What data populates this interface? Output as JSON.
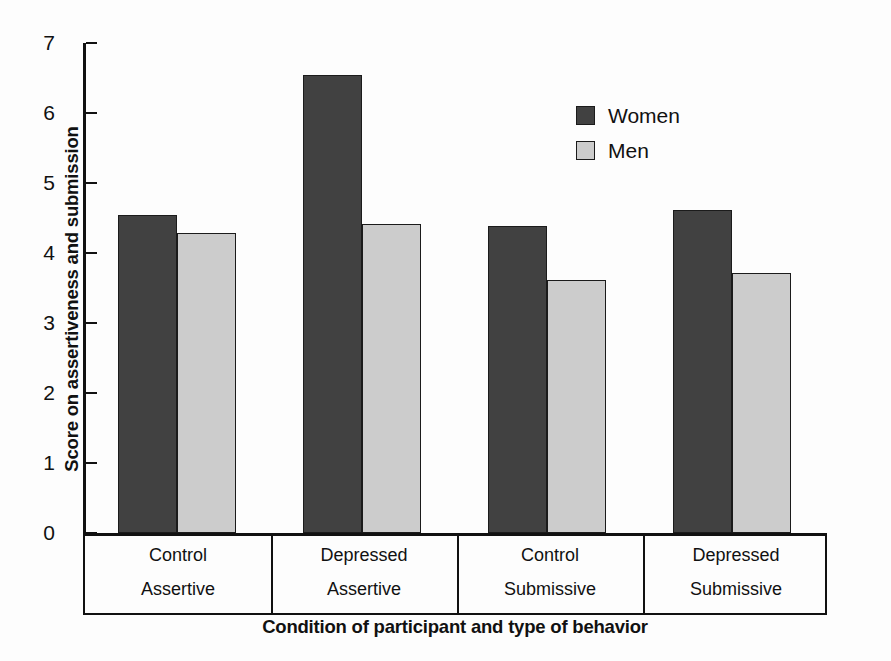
{
  "chart_data": {
    "type": "bar",
    "title": "",
    "xlabel": "Condition of participant and type of behavior",
    "ylabel": "Score on assertiveness and submission",
    "ylim": [
      0,
      7
    ],
    "yticks": [
      "7",
      "6",
      "5",
      "4",
      "3",
      "2",
      "1",
      "0"
    ],
    "grid": false,
    "legend_position": "upper-right",
    "categories": [
      {
        "line1": "Control",
        "line2": "Assertive"
      },
      {
        "line1": "Depressed",
        "line2": "Assertive"
      },
      {
        "line1": "Control",
        "line2": "Submissive"
      },
      {
        "line1": "Depressed",
        "line2": "Submissive"
      }
    ],
    "series": [
      {
        "name": "Women",
        "color": "#414141",
        "values": [
          4.55,
          6.55,
          4.39,
          4.61
        ]
      },
      {
        "name": "Men",
        "color": "#cccccc",
        "values": [
          4.29,
          4.42,
          3.61,
          3.72
        ]
      }
    ]
  },
  "legend": {
    "items": [
      {
        "label": "Women",
        "swatch": "dark-swatch"
      },
      {
        "label": "Men",
        "swatch": "light-swatch"
      }
    ]
  }
}
